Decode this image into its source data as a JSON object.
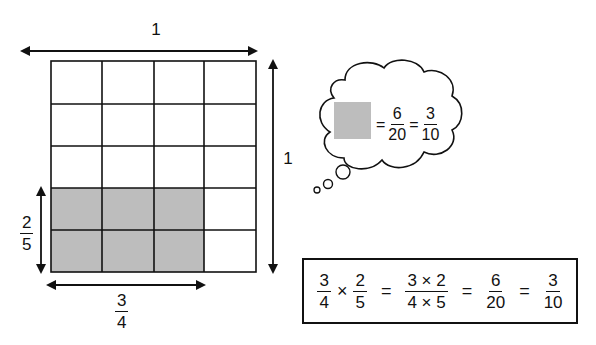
{
  "diagram": {
    "grid": {
      "columns": 4,
      "rows": 5,
      "shaded_columns": 3,
      "shaded_rows": 2,
      "shaded_position": "bottom-left",
      "shaded_color": "#bdbdbd",
      "line_color": "#111111"
    },
    "labels": {
      "top_width": "1",
      "right_height": "1",
      "left_shaded_height": {
        "numerator": "2",
        "denominator": "5"
      },
      "bottom_shaded_width": {
        "numerator": "3",
        "denominator": "4"
      }
    },
    "thought_bubble": {
      "square_color": "#bdbdbd",
      "equals_1": "=",
      "fraction_1": {
        "numerator": "6",
        "denominator": "20"
      },
      "equals_2": "=",
      "fraction_2": {
        "numerator": "3",
        "denominator": "10"
      }
    },
    "equation": {
      "term_1": {
        "numerator": "3",
        "denominator": "4"
      },
      "times": "×",
      "term_2": {
        "numerator": "2",
        "denominator": "5"
      },
      "equals_1": "=",
      "product": {
        "numerator": "3 × 2",
        "denominator": "4 × 5"
      },
      "equals_2": "=",
      "result": {
        "numerator": "6",
        "denominator": "20"
      },
      "equals_3": "=",
      "simplified": {
        "numerator": "3",
        "denominator": "10"
      }
    }
  }
}
